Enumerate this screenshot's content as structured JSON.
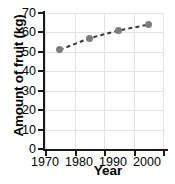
{
  "chart_data": {
    "type": "line",
    "title": "",
    "subtitle": "",
    "xlabel": "Year",
    "ylabel": "Amount of fruit (kg)",
    "x": [
      1970,
      1980,
      1990,
      2000
    ],
    "values": [
      51,
      57,
      61,
      64
    ],
    "series": [
      {
        "name": "Amount of fruit",
        "values": [
          51,
          57,
          61,
          64
        ]
      }
    ],
    "xlim": [
      1965,
      2005
    ],
    "ylim": [
      0,
      70
    ],
    "xticks": [
      1970,
      1980,
      1990,
      2000
    ],
    "yticks": [
      0,
      10,
      20,
      30,
      40,
      50,
      60,
      70
    ],
    "xtick_labels": [
      "1970",
      "1980",
      "1990",
      "2000"
    ],
    "ytick_labels": [
      "0",
      "10",
      "20",
      "30",
      "40",
      "50",
      "60",
      "70"
    ],
    "grid": true,
    "legend": false,
    "legend_position": "none",
    "annotations": [],
    "style": {
      "line_style": "dashed",
      "line_color": "#3a3a3a",
      "marker": "circle",
      "marker_color": "#7d7d7d",
      "grid_color": "#e3e3e3",
      "axis_color": "#1a1a1a",
      "background": "#ffffff"
    }
  }
}
